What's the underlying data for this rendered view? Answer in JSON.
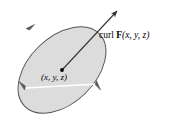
{
  "figure": {
    "name": "curl-of-vector-field-diagram",
    "background_color": "#ffffff",
    "disk": {
      "name": "oriented-disk",
      "fill_color": "#dcdcdc",
      "stroke_color": "#555555",
      "center_x": 62,
      "center_y": 70,
      "semi_major": 52,
      "semi_minor": 33,
      "rotation_deg": -44
    },
    "circulation_arrows": {
      "label": "circulation around boundary",
      "count": 3,
      "positions": [
        {
          "name": "top-left",
          "x": 30,
          "y": 27
        },
        {
          "name": "bottom-left",
          "x": 23,
          "y": 87
        },
        {
          "name": "right",
          "x": 98,
          "y": 84
        }
      ],
      "color": "#555555"
    },
    "curl_vector": {
      "name": "curl-vector-arrow",
      "from_x": 62,
      "from_y": 70,
      "to_x": 118,
      "to_y": 10,
      "color": "#333333",
      "label_text": "curl F(x, y, z)",
      "label_parts": {
        "prefix": "curl",
        "field": "F",
        "args": "(x, y, z)"
      }
    },
    "base_point": {
      "name": "base-point-dot",
      "x": 62,
      "y": 70,
      "color": "#000000",
      "label_text": "(x, y, z)"
    },
    "axis_line": {
      "name": "disk-major-axis",
      "color": "#ffffff",
      "x1": 24,
      "y1": 88,
      "x2": 99,
      "y2": 84
    }
  }
}
